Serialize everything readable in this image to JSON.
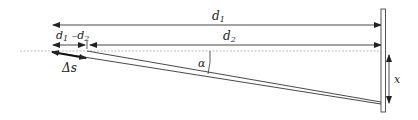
{
  "diagram": {
    "labels": {
      "d1": "d",
      "d1_sub": "1",
      "d2": "d",
      "d2_sub": "2",
      "diff_a": "d",
      "diff_a_sub": "1",
      "diff_minus": " –d",
      "diff_b_sub": "2",
      "delta_s": "Δs",
      "alpha": "α",
      "x": "x"
    },
    "colors": {
      "line": "#333333",
      "dashed": "#999999",
      "background": "#ffffff"
    }
  }
}
